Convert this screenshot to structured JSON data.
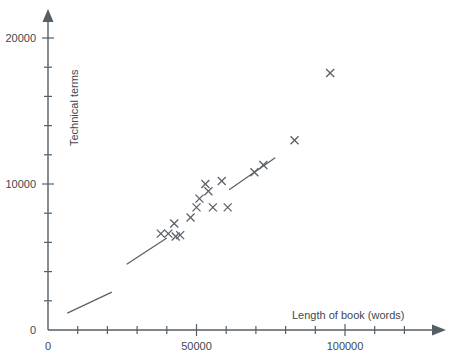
{
  "chart_data": {
    "type": "scatter",
    "title": "",
    "xlabel": "Length of book (words)",
    "ylabel": "Technical terms",
    "xlim": [
      0,
      135000
    ],
    "ylim": [
      0,
      20000
    ],
    "grid": false,
    "legend": null,
    "x_ticks_major": [
      0,
      50000,
      100000
    ],
    "x_tick_labels": [
      "0",
      "50000",
      "100000"
    ],
    "x_ticks_minor": [
      10000,
      20000,
      30000,
      40000,
      60000,
      70000,
      80000,
      90000,
      110000,
      120000,
      130000
    ],
    "y_ticks_major": [
      0,
      10000,
      20000
    ],
    "y_tick_labels": [
      "0",
      "10000",
      "20000"
    ],
    "y_ticks_minor": [
      2000,
      4000,
      6000,
      8000,
      12000,
      14000,
      16000,
      18000
    ],
    "marker": "x",
    "marker_color": "#5a6168",
    "points": [
      {
        "x": 38000,
        "y": 6600
      },
      {
        "x": 40500,
        "y": 6600
      },
      {
        "x": 42500,
        "y": 7300
      },
      {
        "x": 43000,
        "y": 6400
      },
      {
        "x": 44500,
        "y": 6500
      },
      {
        "x": 48000,
        "y": 7700
      },
      {
        "x": 50000,
        "y": 8400
      },
      {
        "x": 51000,
        "y": 9000
      },
      {
        "x": 53000,
        "y": 10000
      },
      {
        "x": 54000,
        "y": 9500
      },
      {
        "x": 55500,
        "y": 8400
      },
      {
        "x": 58500,
        "y": 10200
      },
      {
        "x": 60500,
        "y": 8400
      },
      {
        "x": 69500,
        "y": 10800
      },
      {
        "x": 72500,
        "y": 11300
      },
      {
        "x": 83000,
        "y": 13000
      },
      {
        "x": 95000,
        "y": 17600
      }
    ],
    "trend_segments": [
      {
        "x1": 6500,
        "y1": 1150,
        "x2": 21500,
        "y2": 2600
      },
      {
        "x1": 26500,
        "y1": 4500,
        "x2": 40000,
        "y2": 6300
      },
      {
        "x1": 61000,
        "y1": 9600,
        "x2": 76500,
        "y2": 11800
      }
    ]
  },
  "axes": {
    "x_label": "Length of book (words)",
    "y_label": "Technical terms"
  }
}
